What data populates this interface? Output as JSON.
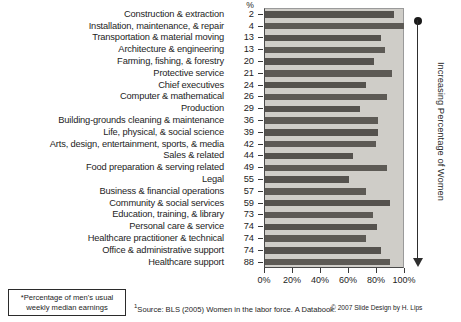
{
  "chart_data": {
    "type": "bar",
    "title": "",
    "orientation": "horizontal",
    "xlabel": "",
    "ylabel": "",
    "xlim": [
      0,
      100
    ],
    "grid": false,
    "legend": null,
    "tick_labels": [
      "0%",
      "20%",
      "40%",
      "60%",
      "80%",
      "100%"
    ],
    "tick_values": [
      0,
      20,
      40,
      60,
      80,
      100
    ],
    "value_column_header": "%",
    "value_column_caption": "Percentage of women in occupation",
    "bar_caption": "Women's earnings as percentage of men's usual weekly median earnings",
    "categories": [
      "Construction & extraction",
      "Installation, maintenance, & repair",
      "Transportation & material moving",
      "Architecture & engineering",
      "Farming, fishing, & forestry",
      "Protective service",
      "Chief executives",
      "Computer & mathematical",
      "Production",
      "Building-grounds cleaning & maintenance",
      "Life, physical, & social science",
      "Arts, design, entertainment, sports, & media",
      "Sales & related",
      "Food preparation & serving related",
      "Legal",
      "Business & financial operations",
      "Community & social services",
      "Education, training, & library",
      "Personal care & service",
      "Healthcare practitioner & technical",
      "Office & administrative support",
      "Healthcare support"
    ],
    "percent_women": [
      2,
      4,
      13,
      13,
      20,
      21,
      24,
      26,
      29,
      36,
      39,
      42,
      44,
      49,
      55,
      57,
      59,
      73,
      74,
      74,
      74,
      88
    ],
    "values": [
      92,
      99,
      83,
      86,
      78,
      91,
      72,
      87,
      68,
      81,
      81,
      79,
      63,
      87,
      60,
      72,
      89,
      77,
      80,
      72,
      83,
      89
    ],
    "axis_annotation": "Increasing Percentage of Women",
    "footnote": "*Percentage of men's usual weekly median earnings",
    "source": "Source: BLS (2005) Women in the labor force. A Databook.",
    "source_marker": "1",
    "credit": "© 2007 Slide Design by H. Lips",
    "colors": {
      "bar": "#55524e",
      "plot_background": "#cfcdc8",
      "page_background": "#ffffff",
      "text": "#1d1d1d",
      "axis": "#2e2e2e"
    }
  },
  "footnote_box": {
    "line1": "*Percentage of men's usual",
    "line2": "weekly median earnings"
  }
}
